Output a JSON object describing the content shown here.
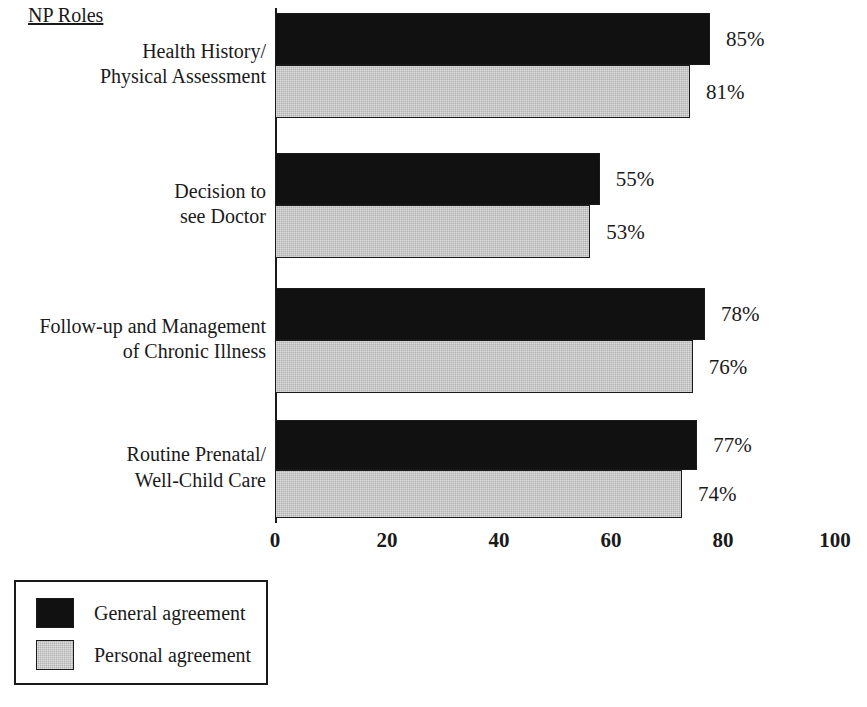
{
  "chart_data": {
    "type": "bar",
    "orientation": "horizontal",
    "title": "NP Roles",
    "xlabel": "",
    "ylabel": "NP Roles",
    "xlim": [
      0,
      100
    ],
    "xticks": [
      0,
      20,
      40,
      60,
      80,
      100
    ],
    "xtick_labels": [
      "0",
      "20",
      "40",
      "60",
      "80",
      "100"
    ],
    "grid": false,
    "legend_position": "bottom-left",
    "categories": [
      "Health History/\nPhysical Assessment",
      "Decision to\nsee Doctor",
      "Follow-up and Management\nof Chronic Illness",
      "Routine Prenatal/\nWell-Child Care"
    ],
    "series": [
      {
        "name": "General agreement",
        "color": "#111111",
        "values": [
          85,
          55,
          78,
          77
        ],
        "value_labels": [
          "85%",
          "55%",
          "78%",
          "77%"
        ],
        "bar_extents": [
          77.7,
          58.0,
          76.8,
          75.4
        ]
      },
      {
        "name": "Personal agreement",
        "color": "#b3b3b3",
        "values": [
          81,
          53,
          76,
          74
        ],
        "value_labels": [
          "81%",
          "53%",
          "76%",
          "74%"
        ],
        "bar_extents": [
          74.1,
          56.3,
          74.6,
          72.7
        ]
      }
    ]
  },
  "legend": {
    "entries": [
      {
        "label": "General agreement",
        "swatch": "general"
      },
      {
        "label": "Personal agreement",
        "swatch": "personal"
      }
    ]
  },
  "colors": {
    "general": "#111111",
    "personal": "#b3b3b3",
    "axis": "#1a1a1a",
    "background": "#ffffff"
  }
}
